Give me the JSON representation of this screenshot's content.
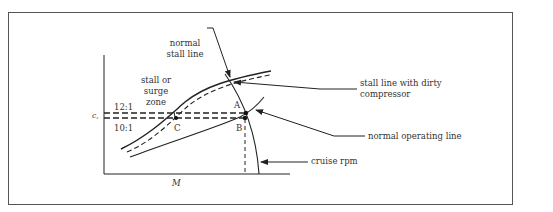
{
  "diagram": {
    "labels": {
      "normal_stall_line": [
        "normal",
        "stall line"
      ],
      "surge_zone": [
        "stall or",
        "surge",
        "zone"
      ],
      "ratio_high": "12:1",
      "ratio_low": "10:1",
      "y_axis": "c,",
      "x_axis": "M",
      "point_a": "A",
      "point_b": "B",
      "point_c": "C",
      "dirty_stall_line": [
        "stall line with dirty",
        "compressor"
      ],
      "operating_line": "normal operating line",
      "cruise_rpm": "cruise rpm"
    },
    "colors": {
      "line": "#222222",
      "text": "#333333",
      "frame": "#555555"
    }
  }
}
